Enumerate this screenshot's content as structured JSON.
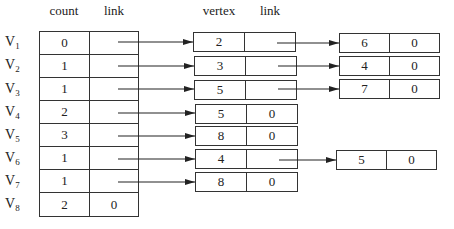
{
  "headers": {
    "count": "count",
    "link": "link",
    "vertex": "vertex",
    "link2": "link"
  },
  "rows": [
    {
      "label": "V",
      "sub": "1",
      "count": "0",
      "link": "",
      "node1": {
        "vertex": "2",
        "link": ""
      },
      "node2": {
        "vertex": "6",
        "link": "0"
      }
    },
    {
      "label": "V",
      "sub": "2",
      "count": "1",
      "link": "",
      "node1": {
        "vertex": "3",
        "link": ""
      },
      "node2": {
        "vertex": "4",
        "link": "0"
      }
    },
    {
      "label": "V",
      "sub": "3",
      "count": "1",
      "link": "",
      "node1": {
        "vertex": "5",
        "link": ""
      },
      "node2": {
        "vertex": "7",
        "link": "0"
      }
    },
    {
      "label": "V",
      "sub": "4",
      "count": "2",
      "link": "",
      "node1": {
        "vertex": "5",
        "link": "0"
      }
    },
    {
      "label": "V",
      "sub": "5",
      "count": "3",
      "link": "",
      "node1": {
        "vertex": "8",
        "link": "0"
      }
    },
    {
      "label": "V",
      "sub": "6",
      "count": "1",
      "link": "",
      "node1": {
        "vertex": "4",
        "link": ""
      },
      "node2": {
        "vertex": "5",
        "link": "0"
      }
    },
    {
      "label": "V",
      "sub": "7",
      "count": "1",
      "link": "",
      "node1": {
        "vertex": "8",
        "link": "0"
      }
    },
    {
      "label": "V",
      "sub": "8",
      "count": "2",
      "link": "0"
    }
  ],
  "colors": {
    "line": "#333333",
    "background": "#ffffff"
  }
}
